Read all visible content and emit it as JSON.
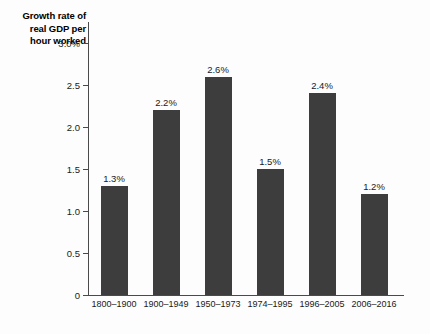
{
  "chart_data": {
    "type": "bar",
    "title": "Growth rate of real GDP per hour worked",
    "title_lines": [
      "Growth rate of",
      "real GDP per",
      "hour worked"
    ],
    "xlabel": "",
    "ylabel": "Growth rate of real GDP per hour worked",
    "categories": [
      "1800–1900",
      "1900–1949",
      "1950–1973",
      "1974–1995",
      "1996–2005",
      "2006–2016"
    ],
    "values": [
      1.3,
      2.2,
      2.6,
      1.5,
      2.4,
      1.2
    ],
    "value_labels": [
      "1.3%",
      "2.2%",
      "2.6%",
      "1.5%",
      "2.4%",
      "1.2%"
    ],
    "ylim": [
      0,
      3.25
    ],
    "y_ticks": [
      0,
      0.5,
      1.0,
      1.5,
      2.0,
      2.5,
      3.0
    ],
    "y_tick_labels": [
      "0",
      "0.5",
      "1.0",
      "1.5",
      "2.0",
      "2.5",
      "3.0%"
    ],
    "grid": false,
    "legend": null,
    "bar_color": "#3d3d3d",
    "axis_color": "#4a4a4a",
    "background_color": "#fdfdfd"
  }
}
